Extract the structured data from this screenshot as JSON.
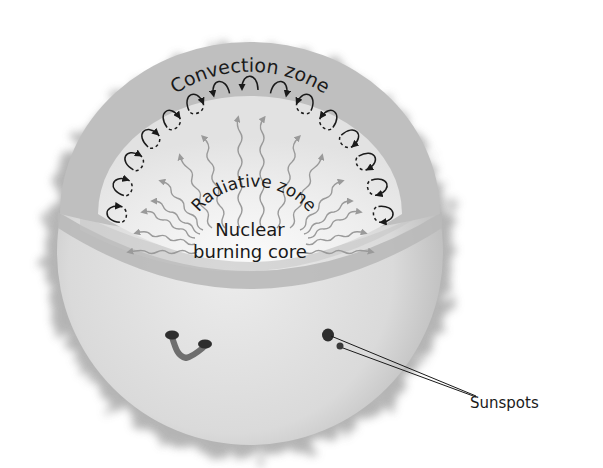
{
  "diagram": {
    "labels": {
      "convection_zone": "Convection zone",
      "radiative_zone": "Radiative zone",
      "core_line1": "Nuclear",
      "core_line2": "burning core",
      "sunspots": "Sunspots"
    },
    "layers": [
      {
        "name": "Nuclear burning core",
        "color": "#f2f2f2"
      },
      {
        "name": "Radiative zone",
        "color": "#e6e6e6",
        "arrow_color": "#9a9a9a"
      },
      {
        "name": "Convection zone",
        "color": "#bdbdbd",
        "loop_color": "#1a1a1a"
      },
      {
        "name": "Photosphere surface",
        "color": "#d9d9d9"
      },
      {
        "name": "Corona/chromosphere glow",
        "color": "#9c9c9c"
      }
    ],
    "features": {
      "sunspot_count_pointed": 2,
      "sunspot_group_left": "U-shaped bipolar sunspot pair"
    }
  }
}
